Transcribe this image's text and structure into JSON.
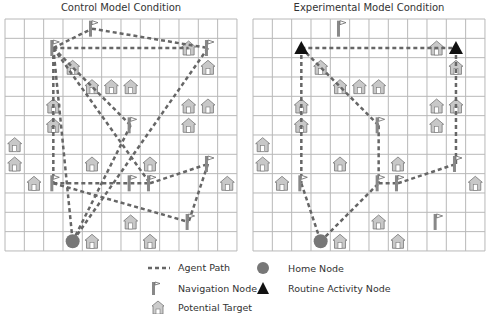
{
  "panels": [
    {
      "title": "Control Model Condition",
      "origin": [
        5,
        19
      ],
      "flags": [
        [
          4,
          0
        ],
        [
          2,
          1
        ],
        [
          10,
          1
        ],
        [
          6,
          5
        ],
        [
          10,
          7
        ],
        [
          2,
          8
        ],
        [
          6,
          8
        ],
        [
          7,
          8
        ],
        [
          9,
          10
        ]
      ],
      "houses": [
        [
          9,
          1
        ],
        [
          3,
          2
        ],
        [
          10,
          2
        ],
        [
          4,
          3
        ],
        [
          5,
          3
        ],
        [
          6,
          3
        ],
        [
          2,
          4
        ],
        [
          9,
          4
        ],
        [
          10,
          4
        ],
        [
          2,
          5
        ],
        [
          9,
          5
        ],
        [
          0,
          6
        ],
        [
          0,
          7
        ],
        [
          4,
          7
        ],
        [
          7,
          7
        ],
        [
          1,
          8
        ],
        [
          11,
          8
        ],
        [
          6,
          10
        ],
        [
          4,
          11
        ],
        [
          7,
          11
        ]
      ],
      "triangles": [],
      "home": [
        3,
        11
      ],
      "paths": [
        [
          [
            2,
            1
          ],
          [
            4,
            0
          ]
        ],
        [
          [
            4,
            0
          ],
          [
            10,
            1
          ]
        ],
        [
          [
            2,
            1
          ],
          [
            9,
            1
          ]
        ],
        [
          [
            10,
            1
          ],
          [
            3,
            11
          ]
        ],
        [
          [
            2,
            1
          ],
          [
            2,
            8
          ]
        ],
        [
          [
            2,
            1
          ],
          [
            6,
            5
          ]
        ],
        [
          [
            2,
            1
          ],
          [
            7,
            8
          ]
        ],
        [
          [
            6,
            5
          ],
          [
            3,
            11
          ]
        ],
        [
          [
            2,
            1
          ],
          [
            3,
            11
          ]
        ],
        [
          [
            2,
            8
          ],
          [
            7,
            8
          ]
        ],
        [
          [
            2,
            8
          ],
          [
            9,
            10
          ]
        ],
        [
          [
            7,
            8
          ],
          [
            10,
            7
          ]
        ],
        [
          [
            10,
            7
          ],
          [
            9,
            10
          ]
        ]
      ]
    },
    {
      "title": "Experimental Model Condition",
      "origin": [
        253,
        19
      ],
      "flags": [
        [
          4,
          0
        ],
        [
          6,
          5
        ],
        [
          10,
          7
        ],
        [
          2,
          8
        ],
        [
          6,
          8
        ],
        [
          7,
          8
        ],
        [
          9,
          10
        ]
      ],
      "houses": [
        [
          9,
          1
        ],
        [
          3,
          2
        ],
        [
          10,
          2
        ],
        [
          4,
          3
        ],
        [
          5,
          3
        ],
        [
          6,
          3
        ],
        [
          2,
          4
        ],
        [
          9,
          4
        ],
        [
          10,
          4
        ],
        [
          2,
          5
        ],
        [
          9,
          5
        ],
        [
          0,
          6
        ],
        [
          0,
          7
        ],
        [
          4,
          7
        ],
        [
          7,
          7
        ],
        [
          1,
          8
        ],
        [
          11,
          8
        ],
        [
          6,
          10
        ],
        [
          4,
          11
        ],
        [
          7,
          11
        ]
      ],
      "triangles": [
        [
          2,
          1
        ],
        [
          10,
          1
        ]
      ],
      "home": [
        3,
        11
      ],
      "paths": [
        [
          [
            2,
            1
          ],
          [
            10,
            1
          ]
        ],
        [
          [
            2,
            1
          ],
          [
            6,
            5
          ]
        ],
        [
          [
            2,
            1
          ],
          [
            2,
            8
          ]
        ],
        [
          [
            10,
            1
          ],
          [
            10,
            7
          ]
        ],
        [
          [
            6,
            5
          ],
          [
            6,
            8
          ]
        ],
        [
          [
            6,
            8
          ],
          [
            7,
            8
          ]
        ],
        [
          [
            7,
            8
          ],
          [
            10,
            7
          ]
        ],
        [
          [
            2,
            8
          ],
          [
            3,
            11
          ]
        ],
        [
          [
            3,
            11
          ],
          [
            6,
            8
          ]
        ]
      ]
    }
  ],
  "grid": {
    "cols": 12,
    "rows": 12,
    "cell": 19.33
  },
  "colors": {
    "grid": "#b8b8b8",
    "path": "#666666",
    "house_fill": "#c8c8c8",
    "home_fill": "#777777",
    "triangle": "#111111"
  },
  "legend": {
    "agent_path": "Agent Path",
    "home_node": "Home Node",
    "navigation_node": "Navigation Node",
    "routine_activity_node": "Routine Activity Node",
    "potential_target": "Potential Target"
  }
}
